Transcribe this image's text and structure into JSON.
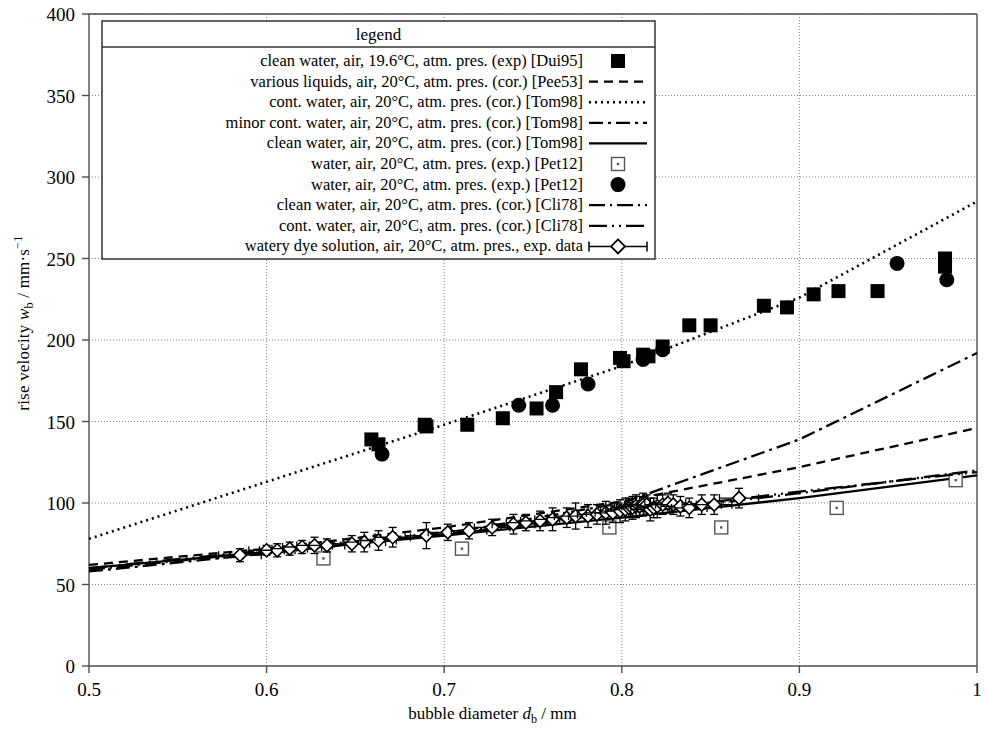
{
  "chart_data": {
    "type": "scatter",
    "title": "",
    "xlabel": "bubble diameter d_b / mm",
    "ylabel": "rise velocity w_b / mm·s⁻¹",
    "xlim": [
      0.5,
      1.0
    ],
    "ylim": [
      0,
      400
    ],
    "xticks": [
      "0.5",
      "0.6",
      "0.7",
      "0.8",
      "0.9",
      "1"
    ],
    "xtick_values": [
      0.5,
      0.6,
      0.7,
      0.8,
      0.9,
      1.0
    ],
    "yticks": [
      "0",
      "50",
      "100",
      "150",
      "200",
      "250",
      "300",
      "350",
      "400"
    ],
    "ytick_values": [
      0,
      50,
      100,
      150,
      200,
      250,
      300,
      350,
      400
    ],
    "grid": true,
    "legend_position": "top-center",
    "legend_title": "legend",
    "series": [
      {
        "name": "clean water, air, 19.6°C, atm. pres. (exp) [Dui95]",
        "style": "marker",
        "marker": "filled-square",
        "points": [
          [
            0.659,
            139
          ],
          [
            0.663,
            136
          ],
          [
            0.689,
            148
          ],
          [
            0.69,
            147
          ],
          [
            0.713,
            148
          ],
          [
            0.733,
            152
          ],
          [
            0.752,
            158
          ],
          [
            0.763,
            168
          ],
          [
            0.777,
            182
          ],
          [
            0.799,
            189
          ],
          [
            0.801,
            187
          ],
          [
            0.812,
            191
          ],
          [
            0.815,
            190
          ],
          [
            0.823,
            196
          ],
          [
            0.838,
            209
          ],
          [
            0.85,
            209
          ],
          [
            0.88,
            221
          ],
          [
            0.893,
            220
          ],
          [
            0.908,
            228
          ],
          [
            0.922,
            230
          ],
          [
            0.944,
            230
          ],
          [
            0.982,
            250
          ],
          [
            0.982,
            245
          ]
        ]
      },
      {
        "name": "various liquids, air, 20°C, atm. pres. (cor.) [Pee53]",
        "style": "line",
        "dash": "dashed",
        "line": [
          [
            0.5,
            62
          ],
          [
            0.6,
            72
          ],
          [
            0.7,
            85
          ],
          [
            0.8,
            101
          ],
          [
            0.9,
            122
          ],
          [
            1.0,
            146
          ]
        ]
      },
      {
        "name": "cont. water, air, 20°C, atm. pres. (cor.) [Tom98]",
        "style": "line",
        "dash": "dotted",
        "line": [
          [
            0.5,
            78
          ],
          [
            0.6,
            113
          ],
          [
            0.7,
            148
          ],
          [
            0.8,
            184
          ],
          [
            0.9,
            226
          ],
          [
            1.0,
            285
          ]
        ]
      },
      {
        "name": "minor cont. water, air, 20°C, atm. pres. (cor.) [Tom98]",
        "style": "line",
        "dash": "dash-dot",
        "line": [
          [
            0.5,
            58
          ],
          [
            0.6,
            69
          ],
          [
            0.7,
            81
          ],
          [
            0.8,
            100
          ],
          [
            0.9,
            139
          ],
          [
            1.0,
            192
          ]
        ]
      },
      {
        "name": "clean water, air, 20°C, atm. pres. (cor.) [Tom98]",
        "style": "line",
        "dash": "solid",
        "line": [
          [
            0.5,
            60
          ],
          [
            0.6,
            70
          ],
          [
            0.7,
            80
          ],
          [
            0.8,
            91
          ],
          [
            0.9,
            103
          ],
          [
            1.0,
            117
          ]
        ]
      },
      {
        "name": "water, air, 20°C, atm. pres. (exp.) [Pet12]",
        "style": "marker",
        "marker": "open-square",
        "points": [
          [
            0.632,
            66
          ],
          [
            0.71,
            72
          ],
          [
            0.793,
            85
          ],
          [
            0.856,
            85
          ],
          [
            0.921,
            97
          ],
          [
            0.988,
            114
          ]
        ]
      },
      {
        "name": "water, air, 20°C, atm. pres. (exp.) [Pet12]",
        "style": "marker",
        "marker": "filled-circle",
        "points": [
          [
            0.665,
            130
          ],
          [
            0.742,
            160
          ],
          [
            0.761,
            160
          ],
          [
            0.781,
            173
          ],
          [
            0.812,
            188
          ],
          [
            0.823,
            194
          ],
          [
            0.955,
            247
          ],
          [
            0.983,
            237
          ]
        ]
      },
      {
        "name": "clean water, air, 20°C, atm. pres. (cor.) [Cli78]",
        "style": "line",
        "dash": "long-dash-dot",
        "line": [
          [
            0.5,
            59
          ],
          [
            0.6,
            70
          ],
          [
            0.7,
            81
          ],
          [
            0.8,
            93
          ],
          [
            0.9,
            106
          ],
          [
            1.0,
            120
          ]
        ]
      },
      {
        "name": "cont. water, air, 20°C, atm. pres. (cor.) [Cli78]",
        "style": "line",
        "dash": "long-dash-dot-dot",
        "line": [
          [
            0.5,
            60
          ],
          [
            0.6,
            71
          ],
          [
            0.7,
            82
          ],
          [
            0.8,
            94
          ],
          [
            0.9,
            107
          ],
          [
            1.0,
            119
          ]
        ]
      },
      {
        "name": "watery dye solution, air, 20°C, atm. pres., exp. data",
        "style": "marker-errorbar",
        "marker": "open-diamond",
        "points": [
          [
            0.585,
            68,
            0.012,
            4
          ],
          [
            0.6,
            71,
            0.01,
            3
          ],
          [
            0.606,
            71,
            0.01,
            4
          ],
          [
            0.613,
            72,
            0.01,
            4
          ],
          [
            0.62,
            73,
            0.011,
            4
          ],
          [
            0.627,
            74,
            0.01,
            5
          ],
          [
            0.634,
            74,
            0.01,
            4
          ],
          [
            0.648,
            75,
            0.01,
            5
          ],
          [
            0.655,
            76,
            0.012,
            6
          ],
          [
            0.663,
            77,
            0.01,
            6
          ],
          [
            0.671,
            79,
            0.01,
            6
          ],
          [
            0.69,
            80,
            0.012,
            8
          ],
          [
            0.702,
            82,
            0.011,
            5
          ],
          [
            0.714,
            83,
            0.01,
            5
          ],
          [
            0.727,
            85,
            0.01,
            5
          ],
          [
            0.739,
            87,
            0.012,
            6
          ],
          [
            0.746,
            88,
            0.011,
            5
          ],
          [
            0.754,
            89,
            0.011,
            6
          ],
          [
            0.761,
            90,
            0.01,
            7
          ],
          [
            0.769,
            91,
            0.011,
            6
          ],
          [
            0.774,
            92,
            0.012,
            8
          ],
          [
            0.781,
            92,
            0.011,
            7
          ],
          [
            0.786,
            93,
            0.011,
            6
          ],
          [
            0.791,
            94,
            0.011,
            7
          ],
          [
            0.795,
            94,
            0.01,
            6
          ],
          [
            0.799,
            95,
            0.011,
            7
          ],
          [
            0.802,
            96,
            0.011,
            7
          ],
          [
            0.804,
            97,
            0.01,
            6
          ],
          [
            0.806,
            97,
            0.01,
            7
          ],
          [
            0.808,
            98,
            0.011,
            7
          ],
          [
            0.81,
            98,
            0.01,
            6
          ],
          [
            0.812,
            99,
            0.01,
            7
          ],
          [
            0.814,
            99,
            0.01,
            6
          ],
          [
            0.816,
            96,
            0.011,
            7
          ],
          [
            0.818,
            97,
            0.01,
            6
          ],
          [
            0.82,
            98,
            0.011,
            7
          ],
          [
            0.823,
            99,
            0.01,
            6
          ],
          [
            0.826,
            100,
            0.01,
            6
          ],
          [
            0.829,
            99,
            0.01,
            6
          ],
          [
            0.833,
            98,
            0.011,
            6
          ],
          [
            0.838,
            97,
            0.01,
            6
          ],
          [
            0.845,
            99,
            0.011,
            6
          ],
          [
            0.852,
            99,
            0.01,
            6
          ],
          [
            0.866,
            103,
            0.011,
            6
          ]
        ]
      }
    ]
  },
  "axes": {
    "x": {
      "label_prefix": "bubble diameter ",
      "label_symbol": "d",
      "label_sub": "b",
      "label_unit": " / mm"
    },
    "y": {
      "label_prefix": "rise velocity ",
      "label_symbol": "w",
      "label_sub": "b",
      "label_unit": " / mm·s",
      "label_sup": "−1"
    }
  },
  "legend": {
    "title": "legend",
    "entries": [
      {
        "label": "clean water, air, 19.6°C, atm. pres. (exp) [Dui95]",
        "sample": "filled-square"
      },
      {
        "label": "various liquids, air, 20°C, atm. pres. (cor.) [Pee53]",
        "sample": "dashed-line"
      },
      {
        "label": "cont. water, air, 20°C, atm. pres. (cor.) [Tom98]",
        "sample": "dotted-line"
      },
      {
        "label": "minor cont. water, air, 20°C, atm. pres. (cor.) [Tom98]",
        "sample": "dash-dot-line"
      },
      {
        "label": "clean water, air, 20°C, atm. pres. (cor.) [Tom98]",
        "sample": "solid-line"
      },
      {
        "label": "water, air, 20°C, atm. pres. (exp.) [Pet12]",
        "sample": "open-square"
      },
      {
        "label": "water, air, 20°C, atm. pres. (exp.) [Pet12]",
        "sample": "filled-circle"
      },
      {
        "label": "clean water, air, 20°C, atm. pres. (cor.) [Cli78]",
        "sample": "long-dash-dot-line"
      },
      {
        "label": "cont. water, air, 20°C, atm. pres. (cor.) [Cli78]",
        "sample": "long-dash-dot-dot-line"
      },
      {
        "label": "watery dye solution, air, 20°C, atm. pres., exp. data",
        "sample": "errorbar-diamond"
      }
    ]
  },
  "colors": {
    "ink": "#000000",
    "grid": "#808080",
    "axis": "#4d4d4d"
  }
}
